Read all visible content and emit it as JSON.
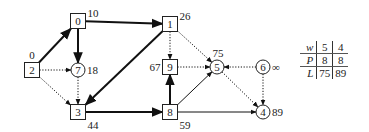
{
  "graph": {
    "nodes": [
      {
        "id": "0",
        "shape": "square",
        "x": 78,
        "y": 21,
        "label": "10",
        "label_pos": "right-top"
      },
      {
        "id": "1",
        "shape": "square",
        "x": 170,
        "y": 24,
        "label": "26",
        "label_pos": "right-top"
      },
      {
        "id": "2",
        "shape": "square",
        "x": 32,
        "y": 70,
        "label": "0",
        "label_pos": "top"
      },
      {
        "id": "7",
        "shape": "circle",
        "x": 78,
        "y": 70,
        "label": "18",
        "label_pos": "right"
      },
      {
        "id": "9",
        "shape": "square",
        "x": 170,
        "y": 67,
        "label": "67",
        "label_pos": "left"
      },
      {
        "id": "5",
        "shape": "circle",
        "x": 217,
        "y": 67,
        "label": "75",
        "label_pos": "top"
      },
      {
        "id": "6",
        "shape": "circle",
        "x": 263,
        "y": 67,
        "label": "∞",
        "label_pos": "right"
      },
      {
        "id": "3",
        "shape": "square",
        "x": 78,
        "y": 112,
        "label": "44",
        "label_pos": "right-bottom"
      },
      {
        "id": "8",
        "shape": "square",
        "x": 170,
        "y": 112,
        "label": "59",
        "label_pos": "right-bottom"
      },
      {
        "id": "4",
        "shape": "circle",
        "x": 263,
        "y": 112,
        "label": "89",
        "label_pos": "right"
      }
    ],
    "edges": [
      {
        "from": "2",
        "to": "0",
        "style": "thick"
      },
      {
        "from": "0",
        "to": "1",
        "style": "thick"
      },
      {
        "from": "0",
        "to": "7",
        "style": "thick"
      },
      {
        "from": "2",
        "to": "7",
        "style": "dotted"
      },
      {
        "from": "2",
        "to": "3",
        "style": "dotted"
      },
      {
        "from": "7",
        "to": "3",
        "style": "dotted"
      },
      {
        "from": "1",
        "to": "3",
        "style": "thick"
      },
      {
        "from": "1",
        "to": "9",
        "style": "dotted"
      },
      {
        "from": "1",
        "to": "5",
        "style": "dotted"
      },
      {
        "from": "9",
        "to": "5",
        "style": "dotted"
      },
      {
        "from": "3",
        "to": "8",
        "style": "thick"
      },
      {
        "from": "8",
        "to": "9",
        "style": "thick"
      },
      {
        "from": "8",
        "to": "5",
        "style": "thin"
      },
      {
        "from": "8",
        "to": "4",
        "style": "thin"
      },
      {
        "from": "6",
        "to": "5",
        "style": "dotted"
      },
      {
        "from": "6",
        "to": "4",
        "style": "dotted"
      },
      {
        "from": "5",
        "to": "4",
        "style": "dotted"
      }
    ]
  },
  "table": {
    "rows": [
      {
        "header": "w",
        "values": [
          "5",
          "4"
        ]
      },
      {
        "header": "P",
        "values": [
          "8",
          "8"
        ]
      },
      {
        "header": "L",
        "values": [
          "75",
          "89"
        ]
      }
    ]
  }
}
